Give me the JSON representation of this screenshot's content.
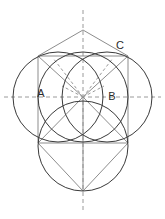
{
  "figure": {
    "background_color": "#ffffff",
    "width": 165,
    "height": 219,
    "colors": {
      "circle_stroke": "#3a3a3a",
      "dashed_axis": "#9a9a9a",
      "segment": "#8d8d8d",
      "label": "#2b2b2b"
    },
    "labels": [
      {
        "id": "A",
        "text": "A",
        "x": 41,
        "y": 97
      },
      {
        "id": "B",
        "text": "B",
        "x": 110,
        "y": 100
      },
      {
        "id": "C",
        "text": "C",
        "x": 118,
        "y": 49
      }
    ],
    "circles": [
      {
        "id": "left-circle",
        "cx": 58,
        "cy": 97,
        "r": 45
      },
      {
        "id": "right-circle",
        "cx": 107,
        "cy": 97,
        "r": 45
      },
      {
        "id": "top-circle",
        "cx": 83,
        "cy": 97,
        "r": 45
      },
      {
        "id": "bottom-circle",
        "cx": 83,
        "cy": 146,
        "r": 45
      }
    ],
    "axes": [
      {
        "id": "vertical-axis",
        "x1": 83,
        "y1": 10,
        "x2": 83,
        "y2": 212
      },
      {
        "id": "horizontal-axis",
        "x1": 4,
        "y1": 97,
        "x2": 161,
        "y2": 97
      }
    ],
    "rays": [
      {
        "id": "ray-center-to-upper-left",
        "x1": 83,
        "y1": 97,
        "x2": 53,
        "y2": 58
      },
      {
        "id": "ray-center-to-upper-right",
        "x1": 83,
        "y1": 97,
        "x2": 113,
        "y2": 58
      },
      {
        "id": "ray-center-to-left",
        "x1": 83,
        "y1": 97,
        "x2": 62,
        "y2": 88
      },
      {
        "id": "ray-center-to-right",
        "x1": 83,
        "y1": 97,
        "x2": 104,
        "y2": 88
      }
    ],
    "segments": [
      {
        "id": "apex-to-left-top",
        "x1": 83,
        "y1": 30,
        "x2": 38,
        "y2": 56
      },
      {
        "id": "apex-to-right-top",
        "x1": 83,
        "y1": 30,
        "x2": 128,
        "y2": 56
      },
      {
        "id": "left-top-to-center",
        "x1": 38,
        "y1": 56,
        "x2": 83,
        "y2": 97
      },
      {
        "id": "right-top-to-center",
        "x1": 128,
        "y1": 56,
        "x2": 83,
        "y2": 97
      },
      {
        "id": "left-top-to-apexline",
        "x1": 38,
        "y1": 56,
        "x2": 83,
        "y2": 56
      },
      {
        "id": "right-top-to-apexline",
        "x1": 128,
        "y1": 56,
        "x2": 83,
        "y2": 56
      },
      {
        "id": "center-to-left-low",
        "x1": 83,
        "y1": 97,
        "x2": 38,
        "y2": 143
      },
      {
        "id": "center-to-right-low",
        "x1": 83,
        "y1": 97,
        "x2": 128,
        "y2": 143
      },
      {
        "id": "left-low-to-bottom",
        "x1": 38,
        "y1": 143,
        "x2": 83,
        "y2": 191
      },
      {
        "id": "right-low-to-bottom",
        "x1": 128,
        "y1": 143,
        "x2": 83,
        "y2": 191
      },
      {
        "id": "center-to-bottom",
        "x1": 83,
        "y1": 97,
        "x2": 83,
        "y2": 191
      },
      {
        "id": "left-low-to-right-low",
        "x1": 38,
        "y1": 143,
        "x2": 128,
        "y2": 143
      },
      {
        "id": "left-top-to-left-low",
        "x1": 38,
        "y1": 56,
        "x2": 38,
        "y2": 143
      },
      {
        "id": "right-top-to-right-low",
        "x1": 128,
        "y1": 56,
        "x2": 128,
        "y2": 143
      }
    ]
  }
}
